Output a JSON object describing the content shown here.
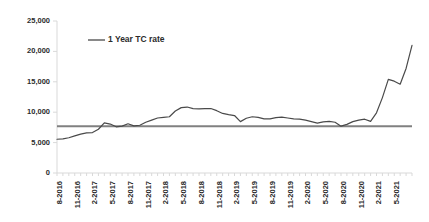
{
  "chart_data": {
    "type": "line",
    "title": "",
    "xlabel": "",
    "ylabel": "",
    "ylim": [
      0,
      25000
    ],
    "grid": false,
    "legend_position": "top-left-inside",
    "y_ticks": [
      0,
      5000,
      10000,
      15000,
      20000,
      25000
    ],
    "y_tick_labels": [
      "0",
      "5,000",
      "10,000",
      "15,000",
      "20,000",
      "25,000"
    ],
    "x_tick_labels": [
      "8-2016",
      "11-2016",
      "2-2017",
      "5-2017",
      "8-2017",
      "11-2017",
      "2-2018",
      "5-2018",
      "8-2018",
      "11-2018",
      "2-2019",
      "5-2019",
      "8-2019",
      "11-2019",
      "2-2020",
      "5-2020",
      "8-2020",
      "11-2020",
      "2-2021",
      "5-2021"
    ],
    "x_tick_every_n_points": 3,
    "series": [
      {
        "name": "1 Year TC rate",
        "color": "#4a4a4a",
        "x": [
          "8-2016",
          "9-2016",
          "10-2016",
          "11-2016",
          "12-2016",
          "1-2017",
          "2-2017",
          "3-2017",
          "4-2017",
          "5-2017",
          "6-2017",
          "7-2017",
          "8-2017",
          "9-2017",
          "10-2017",
          "11-2017",
          "12-2017",
          "1-2018",
          "2-2018",
          "3-2018",
          "4-2018",
          "5-2018",
          "6-2018",
          "7-2018",
          "8-2018",
          "9-2018",
          "10-2018",
          "11-2018",
          "12-2018",
          "1-2019",
          "2-2019",
          "3-2019",
          "4-2019",
          "5-2019",
          "6-2019",
          "7-2019",
          "8-2019",
          "9-2019",
          "10-2019",
          "11-2019",
          "12-2019",
          "1-2020",
          "2-2020",
          "3-2020",
          "4-2020",
          "5-2020",
          "6-2020",
          "7-2020",
          "8-2020",
          "9-2020",
          "10-2020",
          "11-2020",
          "12-2020",
          "1-2021",
          "2-2021",
          "3-2021",
          "4-2021",
          "5-2021",
          "6-2021",
          "7-2021",
          "8-2021"
        ],
        "values": [
          5550,
          5600,
          5800,
          6100,
          6400,
          6600,
          6650,
          7200,
          8250,
          8050,
          7600,
          7700,
          8100,
          7750,
          7850,
          8350,
          8700,
          9050,
          9150,
          9250,
          10200,
          10750,
          10850,
          10600,
          10550,
          10600,
          10600,
          10250,
          9800,
          9600,
          9450,
          8450,
          9000,
          9250,
          9150,
          8900,
          8900,
          9100,
          9200,
          9050,
          8900,
          8850,
          8700,
          8450,
          8200,
          8400,
          8500,
          8350,
          7700,
          8000,
          8450,
          8700,
          8850,
          8500,
          9900,
          12400,
          15400,
          15100,
          14600,
          17200,
          21000
        ]
      }
    ],
    "reference_line": {
      "name": "reference",
      "value": 7700,
      "color": "#808080"
    }
  },
  "legend": {
    "entries": [
      {
        "label": "1 Year TC rate",
        "color": "#4a4a4a"
      }
    ]
  }
}
